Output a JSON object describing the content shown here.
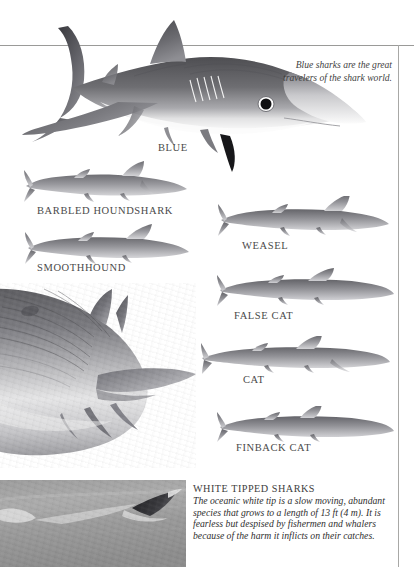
{
  "page": {
    "background_color": "#ffffff",
    "rule_color": "#9a9a98",
    "ink_color": "#3a3a3a"
  },
  "quote": {
    "text": "Blue sharks are the great travelers of the shark world."
  },
  "species": [
    {
      "id": "blue",
      "label": "BLUE"
    },
    {
      "id": "barbled-houndshark",
      "label": "BARBLED HOUNDSHARK"
    },
    {
      "id": "smoothhound",
      "label": "SMOOTHHOUND"
    },
    {
      "id": "weasel",
      "label": "WEASEL"
    },
    {
      "id": "false-cat",
      "label": "FALSE CAT"
    },
    {
      "id": "cat",
      "label": "CAT"
    },
    {
      "id": "finback-cat",
      "label": "FINBACK CAT"
    }
  ],
  "info_block": {
    "heading": "WHITE TIPPED SHARKS",
    "body": "The oceanic white tip is a slow moving, abundant species that grows to a length of 13 ft (4 m). It is fearless but despised by fishermen and whalers because of the harm it inflicts on their catches."
  },
  "illustrations": {
    "blue_shark": "blue-shark-illustration",
    "large_shark": "large-shark-engraving",
    "photo": "white-tip-shark-photograph"
  }
}
